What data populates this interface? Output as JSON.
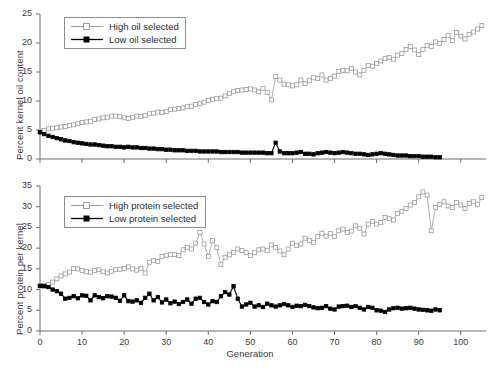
{
  "figure": {
    "background": "#ffffff",
    "axis_color": "#6e6e6e",
    "text_color": "#3a3a3a"
  },
  "chart_data": [
    {
      "id": "oil",
      "type": "line",
      "title": "",
      "xlabel": "",
      "ylabel": "Percent kernel oil content",
      "xlim": [
        0,
        106
      ],
      "ylim": [
        0,
        25
      ],
      "xticks": [
        0,
        10,
        20,
        30,
        40,
        50,
        60,
        70,
        80,
        90,
        100
      ],
      "yticks": [
        0,
        5,
        10,
        15,
        20,
        25
      ],
      "grid": false,
      "legend_position": "upper-left",
      "series": [
        {
          "name": "High oil selected",
          "marker": "open-square",
          "color": "#9a9a9a",
          "x": [
            0,
            1,
            2,
            3,
            4,
            5,
            6,
            7,
            8,
            9,
            10,
            11,
            12,
            13,
            14,
            15,
            16,
            17,
            18,
            19,
            20,
            21,
            22,
            23,
            24,
            25,
            26,
            27,
            28,
            29,
            30,
            31,
            32,
            33,
            34,
            35,
            36,
            37,
            38,
            39,
            40,
            41,
            42,
            43,
            44,
            45,
            46,
            47,
            48,
            49,
            50,
            51,
            52,
            53,
            54,
            55,
            56,
            57,
            58,
            59,
            60,
            61,
            62,
            63,
            64,
            65,
            66,
            67,
            68,
            69,
            70,
            71,
            72,
            73,
            74,
            75,
            76,
            77,
            78,
            79,
            80,
            81,
            82,
            83,
            84,
            85,
            86,
            87,
            88,
            89,
            90,
            91,
            92,
            93,
            94,
            95,
            96,
            97,
            98,
            99,
            100,
            101,
            102,
            103,
            104,
            105
          ],
          "y": [
            4.7,
            4.9,
            5.2,
            5.3,
            5.4,
            5.5,
            5.6,
            5.8,
            5.9,
            6.1,
            6.3,
            6.4,
            6.5,
            6.8,
            6.9,
            7.1,
            7.2,
            7.4,
            7.4,
            7.3,
            7.1,
            7.0,
            7.2,
            7.4,
            7.3,
            7.5,
            7.8,
            7.9,
            8.1,
            8.0,
            8.2,
            8.5,
            8.6,
            8.7,
            8.8,
            9.0,
            9.1,
            9.4,
            9.6,
            9.8,
            10.1,
            10.3,
            10.4,
            10.5,
            10.9,
            11.3,
            11.6,
            11.8,
            11.9,
            12.0,
            12.1,
            11.9,
            11.6,
            12.2,
            11.5,
            10.2,
            14.2,
            13.6,
            12.9,
            12.8,
            12.6,
            12.8,
            13.6,
            13.0,
            13.5,
            14.0,
            13.9,
            14.5,
            13.6,
            13.9,
            14.3,
            15.1,
            15.3,
            15.2,
            15.6,
            15.0,
            14.5,
            15.3,
            16.1,
            16.0,
            16.5,
            16.9,
            17.3,
            17.5,
            17.2,
            17.9,
            18.2,
            18.9,
            19.4,
            18.8,
            18.0,
            18.9,
            19.6,
            19.4,
            20.2,
            19.9,
            20.6,
            21.3,
            20.4,
            21.8,
            21.2,
            20.7,
            21.5,
            21.9,
            22.4,
            23.0
          ]
        },
        {
          "name": "Low oil selected",
          "marker": "filled-square",
          "color": "#000000",
          "x": [
            0,
            1,
            2,
            3,
            4,
            5,
            6,
            7,
            8,
            9,
            10,
            11,
            12,
            13,
            14,
            15,
            16,
            17,
            18,
            19,
            20,
            21,
            22,
            23,
            24,
            25,
            26,
            27,
            28,
            29,
            30,
            31,
            32,
            33,
            34,
            35,
            36,
            37,
            38,
            39,
            40,
            41,
            42,
            43,
            44,
            45,
            46,
            47,
            48,
            49,
            50,
            51,
            52,
            53,
            54,
            55,
            56,
            57,
            58,
            59,
            60,
            61,
            62,
            63,
            64,
            65,
            66,
            67,
            68,
            69,
            70,
            71,
            72,
            73,
            74,
            75,
            76,
            77,
            78,
            79,
            80,
            81,
            82,
            83,
            84,
            85,
            86,
            87,
            88,
            89,
            90,
            91,
            92,
            93,
            94,
            95
          ],
          "y": [
            4.6,
            4.3,
            4.0,
            3.8,
            3.6,
            3.4,
            3.2,
            3.1,
            2.9,
            2.8,
            2.7,
            2.6,
            2.5,
            2.5,
            2.4,
            2.3,
            2.2,
            2.2,
            2.1,
            2.1,
            2.0,
            2.1,
            2.0,
            2.0,
            1.9,
            1.9,
            1.8,
            1.8,
            1.7,
            1.7,
            1.6,
            1.6,
            1.5,
            1.5,
            1.5,
            1.4,
            1.4,
            1.4,
            1.3,
            1.3,
            1.3,
            1.3,
            1.3,
            1.2,
            1.2,
            1.2,
            1.2,
            1.2,
            1.1,
            1.1,
            1.1,
            1.1,
            1.1,
            1.1,
            1.0,
            1.0,
            2.8,
            1.3,
            1.0,
            1.0,
            1.0,
            1.1,
            1.2,
            0.9,
            0.9,
            0.8,
            1.0,
            1.1,
            1.2,
            1.1,
            1.0,
            1.1,
            1.2,
            1.1,
            1.0,
            0.9,
            0.9,
            0.8,
            0.7,
            0.8,
            0.9,
            1.0,
            0.9,
            0.8,
            0.7,
            0.6,
            0.6,
            0.6,
            0.5,
            0.5,
            0.5,
            0.4,
            0.4,
            0.4,
            0.3,
            0.3
          ]
        }
      ]
    },
    {
      "id": "protein",
      "type": "line",
      "title": "",
      "xlabel": "Generation",
      "ylabel": "Percent protein per kernel",
      "xlim": [
        0,
        106
      ],
      "ylim": [
        0,
        35
      ],
      "xticks": [
        0,
        10,
        20,
        30,
        40,
        50,
        60,
        70,
        80,
        90,
        100
      ],
      "yticks": [
        0,
        5,
        10,
        15,
        20,
        25,
        30,
        35
      ],
      "grid": false,
      "legend_position": "upper-left",
      "series": [
        {
          "name": "High protein selected",
          "marker": "open-square",
          "color": "#9a9a9a",
          "x": [
            0,
            1,
            2,
            3,
            4,
            5,
            6,
            7,
            8,
            9,
            10,
            11,
            12,
            13,
            14,
            15,
            16,
            17,
            18,
            19,
            20,
            21,
            22,
            23,
            24,
            25,
            26,
            27,
            28,
            29,
            30,
            31,
            32,
            33,
            34,
            35,
            36,
            37,
            38,
            39,
            40,
            41,
            42,
            43,
            44,
            45,
            46,
            47,
            48,
            49,
            50,
            51,
            52,
            53,
            54,
            55,
            56,
            57,
            58,
            59,
            60,
            61,
            62,
            63,
            64,
            65,
            66,
            67,
            68,
            69,
            70,
            71,
            72,
            73,
            74,
            75,
            76,
            77,
            78,
            79,
            80,
            81,
            82,
            83,
            84,
            85,
            86,
            87,
            88,
            89,
            90,
            91,
            92,
            93,
            94,
            95,
            96,
            97,
            98,
            99,
            100,
            101,
            102,
            103,
            104,
            105
          ],
          "y": [
            10.9,
            11.0,
            11.2,
            11.8,
            12.6,
            13.3,
            13.8,
            14.2,
            15.1,
            15.0,
            14.6,
            14.3,
            14.2,
            14.6,
            14.8,
            14.3,
            14.0,
            14.4,
            14.8,
            14.9,
            15.1,
            15.5,
            15.0,
            14.7,
            15.1,
            14.0,
            16.6,
            17.0,
            16.8,
            18.0,
            18.3,
            18.4,
            18.5,
            18.2,
            19.6,
            20.2,
            19.8,
            21.2,
            23.8,
            21.0,
            18.0,
            21.8,
            20.1,
            16.0,
            17.8,
            18.4,
            19.0,
            19.8,
            19.4,
            18.9,
            18.2,
            18.9,
            19.6,
            19.8,
            19.4,
            20.8,
            20.2,
            19.3,
            18.4,
            19.8,
            21.2,
            20.6,
            21.0,
            22.4,
            21.9,
            21.4,
            22.8,
            23.6,
            22.9,
            23.5,
            22.8,
            24.2,
            24.6,
            23.8,
            24.1,
            25.4,
            24.8,
            23.4,
            25.8,
            26.4,
            25.8,
            26.2,
            27.4,
            27.1,
            26.8,
            28.4,
            28.9,
            29.6,
            30.4,
            31.0,
            32.4,
            33.6,
            32.8,
            24.2,
            29.8,
            30.6,
            31.2,
            30.2,
            29.8,
            31.0,
            30.4,
            29.6,
            30.8,
            31.2,
            30.6,
            32.2
          ]
        },
        {
          "name": "Low protein selected",
          "marker": "filled-square",
          "color": "#000000",
          "x": [
            0,
            1,
            2,
            3,
            4,
            5,
            6,
            7,
            8,
            9,
            10,
            11,
            12,
            13,
            14,
            15,
            16,
            17,
            18,
            19,
            20,
            21,
            22,
            23,
            24,
            25,
            26,
            27,
            28,
            29,
            30,
            31,
            32,
            33,
            34,
            35,
            36,
            37,
            38,
            39,
            40,
            41,
            42,
            43,
            44,
            45,
            46,
            47,
            48,
            49,
            50,
            51,
            52,
            53,
            54,
            55,
            56,
            57,
            58,
            59,
            60,
            61,
            62,
            63,
            64,
            65,
            66,
            67,
            68,
            69,
            70,
            71,
            72,
            73,
            74,
            75,
            76,
            77,
            78,
            79,
            80,
            81,
            82,
            83,
            84,
            85,
            86,
            87,
            88,
            89,
            90,
            91,
            92,
            93,
            94,
            95
          ],
          "y": [
            10.9,
            10.8,
            10.6,
            10.0,
            9.6,
            9.0,
            7.8,
            8.0,
            8.4,
            7.9,
            8.6,
            8.5,
            7.4,
            8.6,
            8.2,
            7.9,
            8.4,
            8.3,
            8.0,
            7.3,
            8.6,
            7.2,
            7.1,
            7.4,
            6.8,
            8.0,
            9.0,
            7.4,
            8.2,
            6.9,
            7.6,
            6.7,
            7.1,
            6.5,
            7.0,
            7.6,
            6.6,
            7.8,
            8.0,
            7.0,
            6.4,
            7.2,
            7.0,
            8.4,
            9.4,
            8.8,
            10.8,
            7.8,
            5.9,
            6.4,
            6.8,
            5.9,
            6.2,
            5.8,
            6.6,
            6.2,
            5.9,
            6.2,
            6.5,
            6.2,
            5.8,
            6.1,
            6.0,
            6.3,
            6.0,
            5.7,
            5.5,
            5.6,
            6.0,
            5.4,
            5.2,
            5.9,
            6.0,
            6.1,
            5.8,
            6.0,
            5.6,
            5.2,
            5.8,
            5.6,
            5.0,
            4.9,
            4.6,
            5.2,
            5.5,
            5.6,
            5.4,
            5.5,
            5.6,
            5.4,
            5.2,
            5.1,
            5.0,
            4.9,
            5.2,
            5.0
          ]
        }
      ]
    }
  ]
}
